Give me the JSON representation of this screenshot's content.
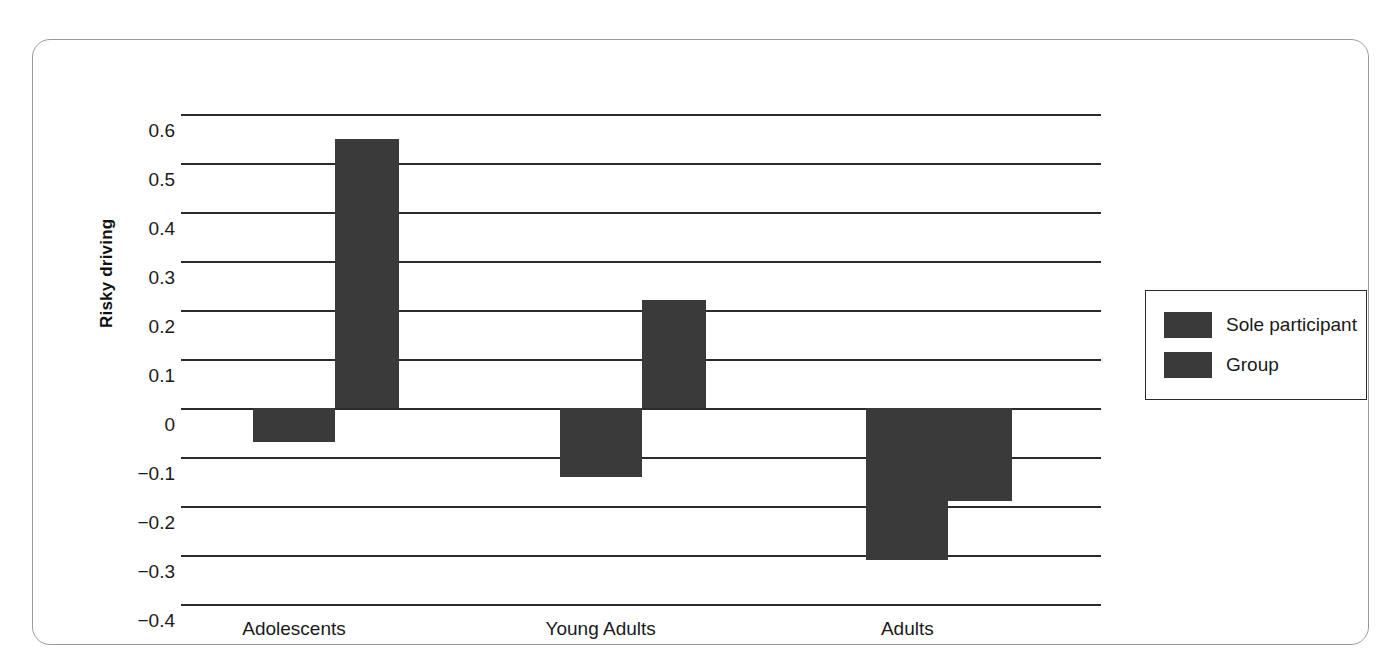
{
  "chart_data": {
    "type": "bar",
    "title": "",
    "subtitle": "",
    "xlabel": "",
    "ylabel": "Risky driving",
    "categories": [
      "Adolescents",
      "Young Adults",
      "Adults"
    ],
    "series": [
      {
        "name": "Sole participant",
        "values": [
          -0.07,
          -0.14,
          -0.31
        ],
        "color": "#3a3a3a"
      },
      {
        "name": "Group",
        "values": [
          0.55,
          0.22,
          -0.19
        ],
        "color": "#3a3a3a"
      }
    ],
    "ylim": [
      -0.4,
      0.6
    ],
    "ytick_values": [
      0.6,
      0.5,
      0.4,
      0.3,
      0.2,
      0.1,
      0,
      -0.1,
      -0.2,
      -0.3,
      -0.4
    ],
    "ytick_labels": [
      "0.6",
      "0.5",
      "0.4",
      "0.3",
      "0.2",
      "0.1",
      "0",
      "−0.1",
      "−0.2",
      "−0.3",
      "−0.4"
    ],
    "grid": true,
    "grid_color": "#2b2b2b",
    "legend_position": "right",
    "legend_entries": [
      "Sole participant",
      "Group"
    ],
    "background": "#ffffff",
    "frame_color": "#9a9a9a"
  },
  "axis": {
    "y_title": "Risky driving"
  },
  "legend": {
    "items": [
      {
        "label": "Sole participant"
      },
      {
        "label": "Group"
      }
    ]
  }
}
